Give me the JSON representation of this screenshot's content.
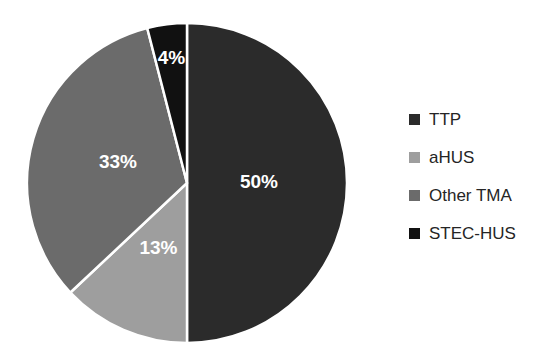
{
  "figure": {
    "background_color": "#ffffff",
    "separator_color": "#ffffff"
  },
  "chart_data": {
    "type": "pie",
    "title": "",
    "subtitle": "",
    "xlabel": "",
    "ylabel": "",
    "categories": [
      "TTP",
      "aHUS",
      "Other TMA",
      "STEC-HUS"
    ],
    "values": [
      50,
      13,
      33,
      4
    ],
    "value_unit": "%",
    "data_labels": [
      "50%",
      "13%",
      "33%",
      "4%"
    ],
    "colors": [
      "#2b2b2b",
      "#9e9e9e",
      "#6b6b6b",
      "#111111"
    ],
    "start_angle_deg": 0,
    "direction": "clockwise",
    "label_color": "#ffffff",
    "legend": {
      "position": "right",
      "entries": [
        {
          "label": "TTP",
          "color": "#2b2b2b"
        },
        {
          "label": "aHUS",
          "color": "#9e9e9e"
        },
        {
          "label": "Other TMA",
          "color": "#6b6b6b"
        },
        {
          "label": "STEC-HUS",
          "color": "#111111"
        }
      ]
    },
    "grid": false,
    "slices": [
      {
        "name": "TTP",
        "value": 50,
        "label": "50%",
        "color": "#2b2b2b"
      },
      {
        "name": "aHUS",
        "value": 13,
        "label": "13%",
        "color": "#9e9e9e"
      },
      {
        "name": "Other TMA",
        "value": 33,
        "label": "33%",
        "color": "#6b6b6b"
      },
      {
        "name": "STEC-HUS",
        "value": 4,
        "label": "4%",
        "color": "#111111"
      }
    ]
  }
}
